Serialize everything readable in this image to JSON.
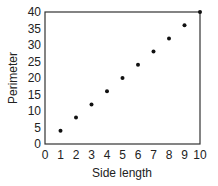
{
  "chart_data": {
    "type": "scatter",
    "title": "",
    "xlabel": "Side length",
    "ylabel": "Perimeter",
    "xlim": [
      0,
      10
    ],
    "ylim": [
      0,
      40
    ],
    "x_ticks": [
      0,
      1,
      2,
      3,
      4,
      5,
      6,
      7,
      8,
      9,
      10
    ],
    "y_ticks": [
      0,
      5,
      10,
      15,
      20,
      25,
      30,
      35,
      40
    ],
    "grid": false,
    "legend": null,
    "series": [
      {
        "name": "Perimeter",
        "x": [
          1,
          2,
          3,
          4,
          5,
          6,
          7,
          8,
          9,
          10
        ],
        "y": [
          4,
          8,
          12,
          16,
          20,
          24,
          28,
          32,
          36,
          40
        ]
      }
    ],
    "marker_color": "#111111",
    "frame_color": "#333333"
  }
}
